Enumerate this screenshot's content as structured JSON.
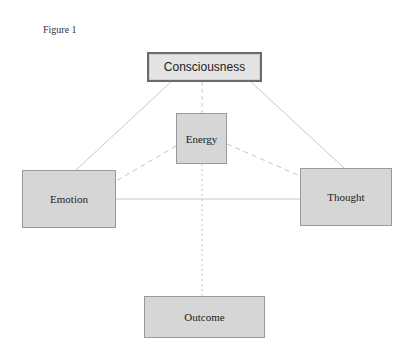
{
  "figure": {
    "label": "Figure 1"
  },
  "nodes": {
    "consciousness": "Consciousness",
    "energy": "Energy",
    "emotion": "Emotion",
    "thought": "Thought",
    "outcome": "Outcome"
  },
  "connections": [
    {
      "from": "Consciousness",
      "to": "Emotion",
      "style": "solid"
    },
    {
      "from": "Consciousness",
      "to": "Thought",
      "style": "solid"
    },
    {
      "from": "Consciousness",
      "to": "Energy",
      "style": "dashed"
    },
    {
      "from": "Energy",
      "to": "Emotion",
      "style": "dashed"
    },
    {
      "from": "Energy",
      "to": "Thought",
      "style": "dashed"
    },
    {
      "from": "Emotion",
      "to": "Thought",
      "style": "solid"
    },
    {
      "from": "Energy",
      "to": "Outcome",
      "style": "dotted"
    }
  ],
  "colors": {
    "node_fill": "#d6d6d6",
    "node_border": "#9a9a9a",
    "top_node_border": "#6a6a6a",
    "line": "#c4c4c4"
  }
}
